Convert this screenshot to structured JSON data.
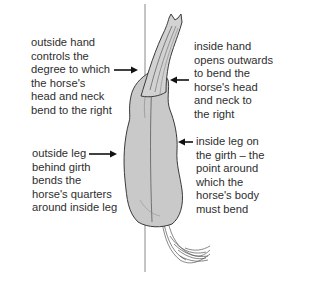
{
  "diagram": {
    "colors": {
      "body_fill": "#c9c9c9",
      "outline": "#3a3a3a",
      "text": "#2e2e2e",
      "center_line": "#8a8a8a"
    },
    "annotations": [
      {
        "id": "outside-hand",
        "lines": [
          "outside hand",
          "controls the",
          "degree to which",
          "the horse's",
          "head and neck",
          "bend to the right"
        ],
        "arrow_direction": "right"
      },
      {
        "id": "inside-hand",
        "lines": [
          "inside hand",
          "opens outwards",
          "to bend the",
          "horse's head",
          "and neck to",
          "the right"
        ],
        "arrow_direction": "left"
      },
      {
        "id": "outside-leg",
        "lines": [
          "outside leg",
          "behind girth",
          "bends the",
          "horse's quarters",
          "around inside leg"
        ],
        "arrow_direction": "right"
      },
      {
        "id": "inside-leg",
        "lines": [
          "inside leg on",
          "the girth – the",
          "point around",
          "which the",
          "horse's body",
          "must bend"
        ],
        "arrow_direction": "left"
      }
    ]
  }
}
